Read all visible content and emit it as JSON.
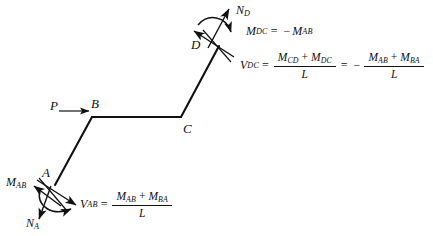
{
  "figure": {
    "type": "structural-free-body-diagram",
    "background_color": "#ffffff",
    "line_color": "#111111"
  },
  "nodes": {
    "a": "A",
    "b": "B",
    "c": "C",
    "d": "D"
  },
  "loads": {
    "p": "P"
  },
  "end_a": {
    "moment_label_m": "M",
    "moment_label_m_sub": "AB",
    "axial_label_n": "N",
    "axial_label_n_sub": "A"
  },
  "end_d": {
    "axial_label_n": "N",
    "axial_label_n_sub": "D"
  },
  "equations": {
    "m_dc": {
      "lhs": "M",
      "lhs_sub": "DC",
      "equals": "=",
      "minus": "−",
      "rhs": "M",
      "rhs_sub": "AB"
    },
    "v_dc": {
      "lhs": "V",
      "lhs_sub": "DC",
      "equals": "=",
      "frac1": {
        "num_t1": "M",
        "num_t1_sub": "CD",
        "plus": "+",
        "num_t2": "M",
        "num_t2_sub": "DC",
        "den": "L"
      },
      "equals2": "=",
      "minus": "−",
      "frac2": {
        "num_t1": "M",
        "num_t1_sub": "AB",
        "plus": "+",
        "num_t2": "M",
        "num_t2_sub": "BA",
        "den": "L"
      }
    },
    "v_ab": {
      "lhs": "V",
      "lhs_sub": "AB",
      "equals": "=",
      "frac": {
        "num_t1": "M",
        "num_t1_sub": "AB",
        "plus": "+",
        "num_t2": "M",
        "num_t2_sub": "BA",
        "den": "L"
      }
    }
  }
}
